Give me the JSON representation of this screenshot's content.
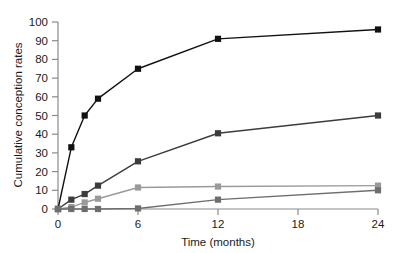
{
  "chart_data": {
    "type": "line",
    "title": "",
    "subtitle": "",
    "xlabel": "Time (months)",
    "ylabel": "Cumulative conception rates",
    "xlim": [
      0,
      24
    ],
    "ylim": [
      0,
      100
    ],
    "xticks": [
      0,
      6,
      12,
      18,
      24
    ],
    "xtick_labels": [
      "0",
      "6",
      "12",
      "18",
      "24"
    ],
    "yticks": [
      0,
      10,
      20,
      30,
      40,
      50,
      60,
      70,
      80,
      90,
      100
    ],
    "ytick_labels": [
      "0",
      "10",
      "20",
      "30",
      "40",
      "50",
      "60",
      "70",
      "80",
      "90",
      "100"
    ],
    "grid": false,
    "legend": false,
    "legend_position": "none",
    "marker": "square",
    "series": [
      {
        "name": "series-1",
        "color": "#111111",
        "x": [
          0,
          1,
          2,
          3,
          6,
          12,
          24
        ],
        "y": [
          0,
          33,
          50,
          59,
          75,
          91,
          96
        ]
      },
      {
        "name": "series-2",
        "color": "#3c3c3c",
        "x": [
          0,
          1,
          2,
          3,
          6,
          12,
          24
        ],
        "y": [
          0,
          5,
          8,
          12.5,
          25.5,
          40.5,
          50
        ]
      },
      {
        "name": "series-3",
        "color": "#9a9a9a",
        "x": [
          0,
          1,
          2,
          3,
          6,
          12,
          24
        ],
        "y": [
          0,
          1,
          3.5,
          5.5,
          11.5,
          12,
          12.5
        ]
      },
      {
        "name": "series-4",
        "color": "#6e6e6e",
        "x": [
          0,
          1,
          2,
          3,
          6,
          12,
          24
        ],
        "y": [
          0,
          0,
          0,
          0,
          0.3,
          5,
          10
        ]
      }
    ]
  },
  "axes": {
    "y_axis_label": "Cumulative conception rates",
    "x_axis_label": "Time (months)"
  }
}
